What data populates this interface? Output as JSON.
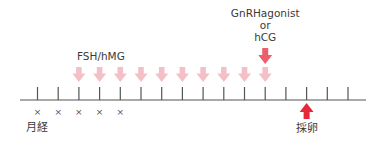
{
  "diagram": {
    "title": "",
    "colors": {
      "axis": "#555555",
      "stim_arrow": "#F4C0C8",
      "trigger_arrow": "#EC5F6A",
      "retrieval_arrow": "#E5283A",
      "text": "#3a3a3a"
    },
    "timeline": {
      "tick_count": 16,
      "labels": {
        "menses": "月経",
        "stimulation": "FSH/hMG",
        "trigger_line1": "GnRHagonist",
        "trigger_line2": "or",
        "trigger_line3": "hCG",
        "retrieval": "採卵"
      },
      "menses_days": [
        0,
        1,
        2,
        3,
        4
      ],
      "menses_marker": "×",
      "stimulation_days": [
        2,
        3,
        4,
        5,
        6,
        7,
        8,
        9,
        10,
        11
      ],
      "trigger_day": 11,
      "retrieval_day": 13
    }
  }
}
